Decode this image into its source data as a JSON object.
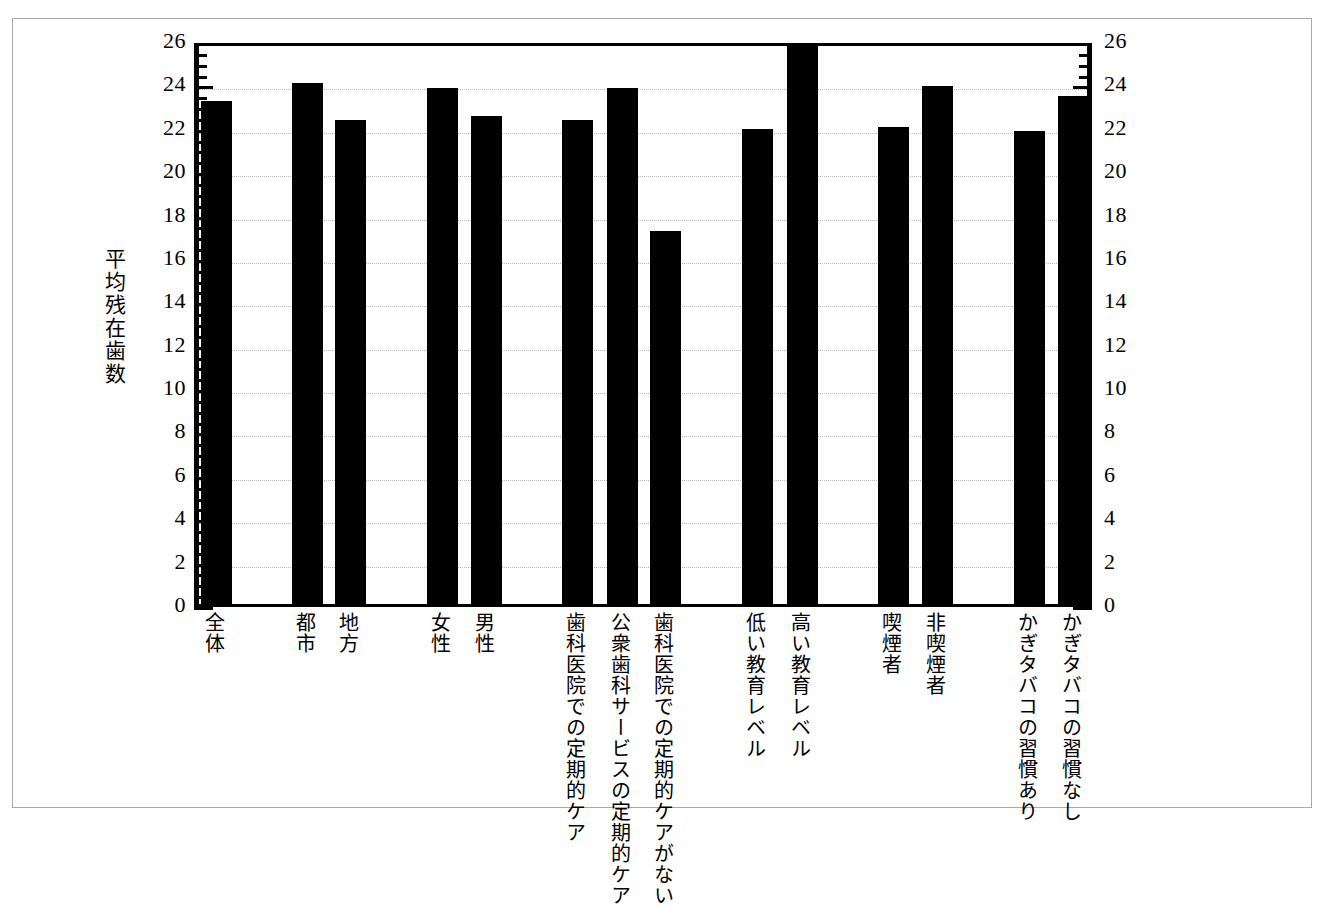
{
  "chart_data": {
    "type": "bar",
    "title": "",
    "xlabel": "",
    "ylabel": "平均残在歯数",
    "ylim": [
      0,
      26
    ],
    "ytick_step": 2,
    "yticks": [
      0,
      2,
      4,
      6,
      8,
      10,
      12,
      14,
      16,
      18,
      20,
      22,
      24,
      26
    ],
    "grid": true,
    "grid_axis": "y",
    "legend": "none",
    "dual_y_axis": true,
    "bar_color": "#000000",
    "categories": [
      "全体",
      "都市",
      "地方",
      "女性",
      "男性",
      "歯科医院での定期的ケア",
      "公衆歯科サービスの定期的ケア",
      "歯科医院での定期的ケアがない",
      "低い教育レベル",
      "高い教育レベル",
      "喫煙者",
      "非喫煙者",
      "かぎタバコの習慣あり",
      "かぎタバコの習慣なし"
    ],
    "values": [
      23.2,
      24.0,
      22.3,
      23.8,
      22.5,
      22.3,
      23.8,
      17.2,
      21.9,
      25.8,
      22.0,
      23.9,
      21.8,
      23.4
    ]
  }
}
